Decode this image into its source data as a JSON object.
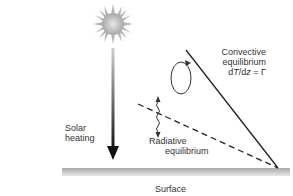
{
  "diagram": {
    "labels": {
      "convective": {
        "line1": "Convective",
        "line2": "equilibrium",
        "line3_prefix": "d",
        "line3_T": "T",
        "line3_mid": "/d",
        "line3_z": "z",
        "line3_suffix": " = Γ"
      },
      "radiative": {
        "line1": "Radiative",
        "line2": "equilibrium"
      },
      "solar": {
        "line1": "Solar",
        "line2": "heating"
      },
      "surface": "Surface"
    },
    "elements": [
      "sun",
      "solar-heating-arrow",
      "convection-loop",
      "radiation-wavy-arrow",
      "convective-profile-line",
      "radiative-profile-line",
      "surface-ground"
    ],
    "colors": {
      "line": "#222222",
      "surface": "#bdbdbd",
      "sun": "#b0b0b0"
    }
  }
}
